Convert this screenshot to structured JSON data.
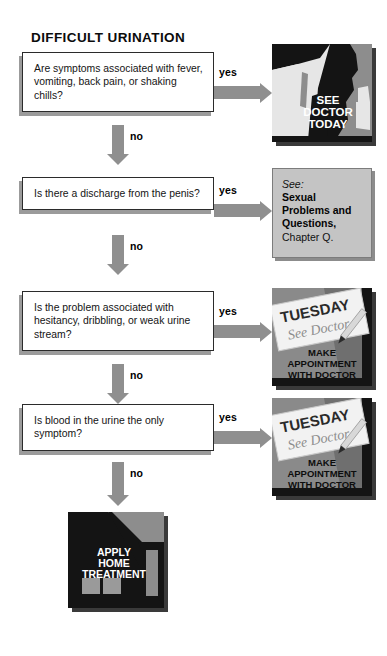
{
  "title": "DIFFICULT URINATION",
  "labels": {
    "yes": "yes",
    "no": "no"
  },
  "questions": [
    {
      "text": "Are symptoms associated with fever, vomiting, back pain, or shaking chills?"
    },
    {
      "text": "Is there a discharge from the penis?"
    },
    {
      "text": "Is the problem associated with hesitancy, dribbling, or weak urine stream?"
    },
    {
      "text": "Is blood in the urine the only symptom?"
    }
  ],
  "outcomes": [
    {
      "kind": "illustration",
      "icon": "doctor-silhouette-icon",
      "lines": [
        "SEE",
        "DOCTOR",
        "TODAY"
      ]
    },
    {
      "kind": "reference",
      "lead": "See:",
      "title": "Sexual Problems and Questions,",
      "chapter": "Chapter Q."
    },
    {
      "kind": "illustration",
      "icon": "calendar-note-icon",
      "note_day": "TUESDAY",
      "note_text": "See Doctor",
      "lines": [
        "MAKE",
        "APPOINTMENT",
        "WITH DOCTOR"
      ]
    },
    {
      "kind": "illustration",
      "icon": "calendar-note-icon",
      "note_day": "TUESDAY",
      "note_text": "See Doctor",
      "lines": [
        "MAKE",
        "APPOINTMENT",
        "WITH DOCTOR"
      ]
    }
  ],
  "final_outcome": {
    "icon": "house-icon",
    "lines": [
      "APPLY",
      "HOME",
      "TREATMENT"
    ]
  },
  "colors": {
    "arrow": "#8f8f8f",
    "box_border": "#2b2b2b",
    "box_shadow": "#9b9b9b",
    "panel_dark": "#141414",
    "panel_mid": "#8d8d8d",
    "panel_light": "#e3e3e3",
    "see_bg": "#c4c4c4"
  }
}
